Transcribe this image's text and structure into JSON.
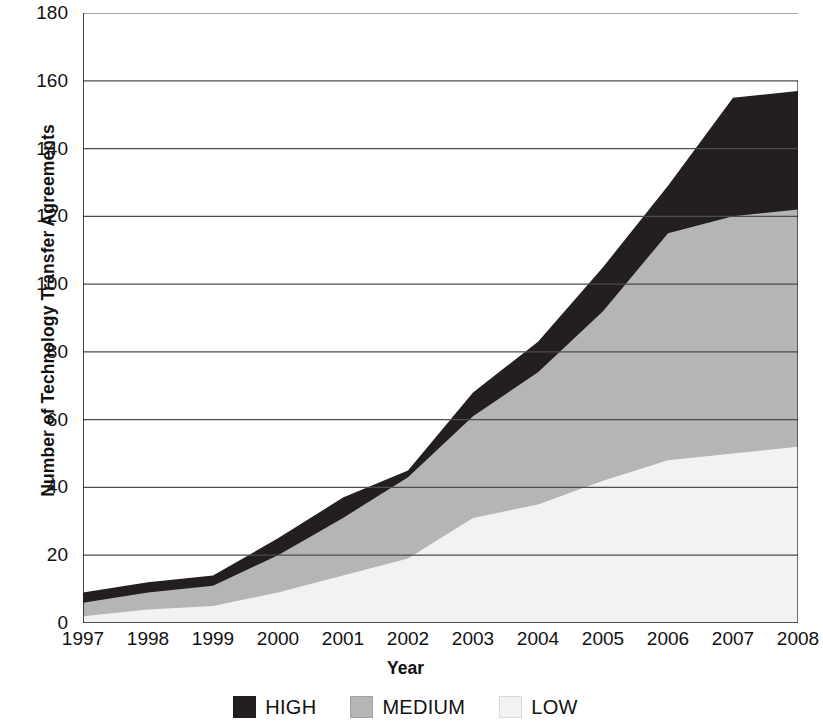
{
  "chart_data": {
    "type": "area",
    "stacked": true,
    "title": "",
    "xlabel": "Year",
    "ylabel": "Number of Technology Transfer Agreements",
    "x": [
      1997,
      1998,
      1999,
      2000,
      2001,
      2002,
      2003,
      2004,
      2005,
      2006,
      2007,
      2008
    ],
    "categories": [
      "1997",
      "1998",
      "1999",
      "2000",
      "2001",
      "2002",
      "2003",
      "2004",
      "2005",
      "2006",
      "2007",
      "2008"
    ],
    "series": [
      {
        "name": "LOW",
        "color": "#f2f2f2",
        "values": [
          2,
          4,
          5,
          9,
          14,
          19,
          31,
          35,
          42,
          48,
          50,
          52
        ]
      },
      {
        "name": "MEDIUM",
        "color": "#b5b5b5",
        "values": [
          4,
          5,
          6,
          11,
          17,
          24,
          30,
          39,
          50,
          67,
          70,
          70
        ]
      },
      {
        "name": "HIGH",
        "color": "#231f1f",
        "values": [
          3,
          3,
          3,
          5,
          6,
          2,
          7,
          9,
          13,
          14,
          35,
          35
        ]
      }
    ],
    "cumulative_tops": {
      "low": [
        2,
        4,
        5,
        9,
        14,
        19,
        31,
        35,
        42,
        48,
        50,
        52
      ],
      "medium": [
        6,
        9,
        11,
        20,
        31,
        43,
        61,
        74,
        92,
        115,
        120,
        122
      ],
      "high": [
        9,
        12,
        14,
        25,
        37,
        45,
        68,
        83,
        105,
        129,
        155,
        157
      ]
    },
    "ylim": [
      0,
      180
    ],
    "yticks": [
      0,
      20,
      40,
      60,
      80,
      100,
      120,
      140,
      160,
      180
    ],
    "ytick_labels": [
      "0",
      "20",
      "40",
      "60",
      "80",
      "100",
      "120",
      "140",
      "160",
      "180"
    ],
    "xticks": [
      "1997",
      "1998",
      "1999",
      "2000",
      "2001",
      "2002",
      "2003",
      "2004",
      "2005",
      "2006",
      "2007",
      "2008"
    ],
    "grid": true,
    "grid_axis": "y",
    "legend_position": "bottom",
    "legend": [
      {
        "label": "HIGH",
        "color": "#231f1f"
      },
      {
        "label": "MEDIUM",
        "color": "#b5b5b5"
      },
      {
        "label": "LOW",
        "color": "#f2f2f2"
      }
    ],
    "colors": {
      "high": "#231f1f",
      "medium": "#b5b5b5",
      "low": "#f2f2f2",
      "axis": "#1a1a1a",
      "grid": "#4d4d4d",
      "background": "#ffffff"
    }
  }
}
